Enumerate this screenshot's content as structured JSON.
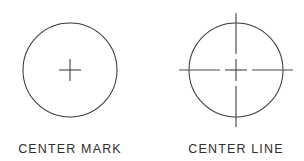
{
  "figure": {
    "background_color": "#ffffff",
    "line_color": "#3a3a3a",
    "text_color": "#2e2e2e",
    "width": 304,
    "height": 161,
    "panels": [
      {
        "id": "center-mark",
        "caption": "CENTER MARK",
        "caption_x": 70,
        "caption_y": 153,
        "circle": {
          "cx": 70,
          "cy": 70,
          "r": 47
        },
        "mark": {
          "type": "plus",
          "style": "solid",
          "half_length": 11,
          "extends_beyond_circle": false
        }
      },
      {
        "id": "center-line",
        "caption": "CENTER LINE",
        "caption_x": 236,
        "caption_y": 153,
        "circle": {
          "cx": 236,
          "cy": 70,
          "r": 47
        },
        "mark": {
          "type": "crosshair",
          "style": "dash-gap",
          "center_half_length": 11,
          "gap": 5,
          "long_dash": 29,
          "extends_beyond_circle": true,
          "horizontal_extent": [
            179,
            293
          ],
          "vertical_extent": [
            13,
            127
          ]
        }
      }
    ]
  }
}
